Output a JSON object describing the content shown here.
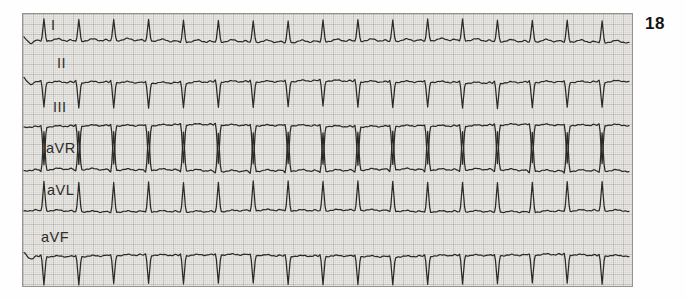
{
  "page": {
    "figure_number": "18",
    "background_color": "#fefefe"
  },
  "ecg": {
    "paper": {
      "x": 22,
      "y": 13,
      "width": 611,
      "height": 274,
      "bg_color": "#eceae6",
      "border_color": "#95948f",
      "grid_minor_color": "rgba(130,130,124,0.10)",
      "grid_major_color": "rgba(110,110,104,0.22)"
    },
    "trace": {
      "color": "#2a2a28",
      "width": 1.25,
      "start_x": 23,
      "end_x": 630
    },
    "rhythm": {
      "regular": true,
      "beat_count": 17,
      "beat_interval_px": 35,
      "beat_positions_px": [
        43,
        78,
        113,
        148,
        183,
        218,
        253,
        288,
        323,
        358,
        393,
        428,
        463,
        498,
        533,
        568,
        603
      ]
    },
    "leads": [
      {
        "id": "I",
        "label": "I",
        "label_x": 50,
        "label_y": 19,
        "baseline_y": 41,
        "qrs_amp": 22,
        "pre_amp": 0,
        "p_amp": 1.6,
        "t_amp": 2.6,
        "start_wave": true,
        "qrs_polarity": "positive"
      },
      {
        "id": "II",
        "label": "II",
        "label_x": 56,
        "label_y": 57,
        "baseline_y": 82,
        "qrs_amp": -25,
        "pre_amp": 2.4,
        "p_amp": 1.4,
        "t_amp": 1.6,
        "start_wave": true,
        "qrs_polarity": "negative"
      },
      {
        "id": "III",
        "label": "III",
        "label_x": 52,
        "label_y": 101,
        "baseline_y": 126,
        "qrs_amp": -38,
        "pre_amp": 1.8,
        "p_amp": 1.3,
        "t_amp": 1.4,
        "start_wave": false,
        "qrs_polarity": "negative"
      },
      {
        "id": "aVR",
        "label": "aVR",
        "label_x": 45,
        "label_y": 142,
        "baseline_y": 171,
        "qrs_amp": 39,
        "pre_amp": -1.6,
        "p_amp": 1.3,
        "t_amp": 1.8,
        "start_wave": false,
        "qrs_polarity": "positive"
      },
      {
        "id": "aVL",
        "label": "aVL",
        "label_x": 46,
        "label_y": 184,
        "baseline_y": 212,
        "qrs_amp": 30,
        "pre_amp": 0,
        "p_amp": 1.3,
        "t_amp": 1.5,
        "start_wave": false,
        "qrs_polarity": "positive"
      },
      {
        "id": "aVF",
        "label": "aVF",
        "label_x": 40,
        "label_y": 231,
        "baseline_y": 257,
        "qrs_amp": -28,
        "pre_amp": 1.8,
        "p_amp": 1.3,
        "t_amp": 1.4,
        "start_wave": true,
        "qrs_polarity": "negative"
      }
    ]
  },
  "chart_data": {
    "type": "line",
    "figure_label": "18",
    "xlabel": "time",
    "ylabel": "voltage",
    "grid": "fine ECG paper grid (minor every 2px, major every 10px)",
    "legend_position": "inline lead labels at left of each trace",
    "rhythm": "regular, 17 beats per strip, beat spacing 35px",
    "beat_positions_px": [
      43,
      78,
      113,
      148,
      183,
      218,
      253,
      288,
      323,
      358,
      393,
      428,
      463,
      498,
      533,
      568,
      603
    ],
    "series": [
      {
        "name": "I",
        "qrs_polarity": "positive",
        "qrs_amplitude_px": 22,
        "baseline_y_px": 41
      },
      {
        "name": "II",
        "qrs_polarity": "negative",
        "qrs_amplitude_px": 25,
        "baseline_y_px": 82
      },
      {
        "name": "III",
        "qrs_polarity": "negative",
        "qrs_amplitude_px": 38,
        "baseline_y_px": 126
      },
      {
        "name": "aVR",
        "qrs_polarity": "positive",
        "qrs_amplitude_px": 39,
        "baseline_y_px": 171
      },
      {
        "name": "aVL",
        "qrs_polarity": "positive",
        "qrs_amplitude_px": 30,
        "baseline_y_px": 212
      },
      {
        "name": "aVF",
        "qrs_polarity": "negative",
        "qrs_amplitude_px": 28,
        "baseline_y_px": 257
      }
    ]
  }
}
